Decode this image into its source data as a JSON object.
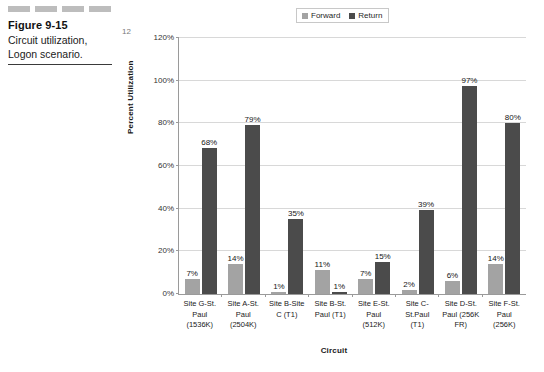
{
  "figure": {
    "number": "Figure 9-15",
    "caption_line1": "Circuit utilization,",
    "caption_line2": "Logon scenario."
  },
  "colors": {
    "forward": "#a3a3a3",
    "return": "#4b4b4b",
    "gridline": "#d8d8d8",
    "axis": "#9a9a9a",
    "dash": "#bdbdbd"
  },
  "legend": {
    "position": "top-center",
    "entries": [
      {
        "label": "Forward",
        "color": "#a3a3a3"
      },
      {
        "label": "Return",
        "color": "#4b4b4b"
      }
    ]
  },
  "chart_data": {
    "type": "bar",
    "title": "",
    "xlabel": "Circuit",
    "ylabel": "Percent Utilization",
    "ylim": [
      0,
      120
    ],
    "yticks": [
      "0%",
      "20%",
      "40%",
      "60%",
      "80%",
      "100%",
      "120%"
    ],
    "ytick_values": [
      0,
      20,
      40,
      60,
      80,
      100,
      120
    ],
    "grid": true,
    "categories": [
      "Site G-St. Paul (1536K)",
      "Site A-St. Paul (2504K)",
      "Site B-Site C (T1)",
      "Site B-St. Paul (T1)",
      "Site E-St. Paul (512K)",
      "Site C-St.Paul (T1)",
      "Site D-St. Paul (256K FR)",
      "Site F-St. Paul (256K)"
    ],
    "category_lines": [
      [
        "Site G-St.",
        "Paul",
        "(1536K)"
      ],
      [
        "Site A-St.",
        "Paul",
        "(2504K)"
      ],
      [
        "Site B-Site",
        "C (T1)"
      ],
      [
        "Site B-St.",
        "Paul (T1)"
      ],
      [
        "Site E-St.",
        "Paul",
        "(512K)"
      ],
      [
        "Site C-",
        "St.Paul",
        "(T1)"
      ],
      [
        "Site D-St.",
        "Paul (256K",
        "FR)"
      ],
      [
        "Site F-St.",
        "Paul",
        "(256K)"
      ]
    ],
    "series": [
      {
        "name": "Forward",
        "color": "#a3a3a3",
        "values": [
          7,
          14,
          1,
          11,
          7,
          2,
          6,
          14
        ],
        "labels": [
          "7%",
          "14%",
          "1%",
          "11%",
          "7%",
          "2%",
          "6%",
          "14%"
        ]
      },
      {
        "name": "Return",
        "color": "#4b4b4b",
        "values": [
          68,
          79,
          35,
          1,
          15,
          39,
          97,
          80
        ],
        "labels": [
          "68%",
          "79%",
          "35%",
          "1%",
          "15%",
          "39%",
          "97%",
          "80%"
        ]
      }
    ]
  },
  "page_number": "12"
}
